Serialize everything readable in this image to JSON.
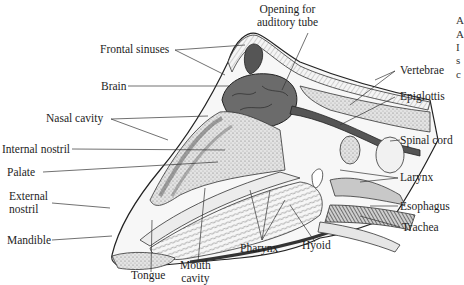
{
  "figure": {
    "labels": {
      "opening_auditory_tube_line1": "Opening for",
      "opening_auditory_tube_line2": "auditory tube",
      "frontal_sinuses": "Frontal sinuses",
      "brain": "Brain",
      "nasal_cavity": "Nasal cavity",
      "internal_nostril": "Internal nostril",
      "palate": "Palate",
      "external_nostril_line1": "External",
      "external_nostril_line2": "nostril",
      "mandible": "Mandible",
      "tongue": "Tongue",
      "mouth_cavity_line1": "Mouth",
      "mouth_cavity_line2": "cavity",
      "pharynx": "Pharynx",
      "hyoid": "Hyoid",
      "vertebrae": "Vertebrae",
      "epiglottis": "Epiglottis",
      "spinal_cord": "Spinal cord",
      "larynx": "Larynx",
      "esophagus": "Esophagus",
      "trachea": "Trachea"
    },
    "edge_fragments": [
      "A",
      "A",
      "I",
      "s",
      "c"
    ]
  },
  "colors": {
    "ink": "#1e1e1e",
    "brain": "#6b6b6b",
    "tissue_light": "#d9d9d9",
    "tissue_mid": "#b3b3b3",
    "bone": "#f1f1f1",
    "background": "#ffffff"
  }
}
